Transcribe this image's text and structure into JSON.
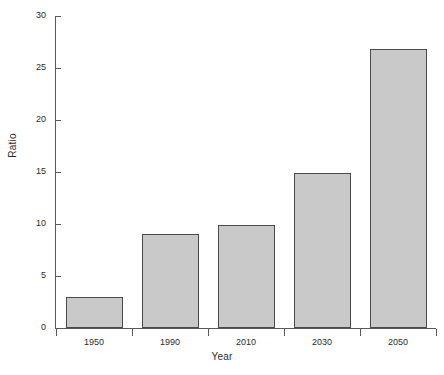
{
  "chart_data": {
    "type": "bar",
    "title": "",
    "subtitle": "",
    "xlabel": "Year",
    "ylabel": "Ratio",
    "categories": [
      "1950",
      "1990",
      "2010",
      "2030",
      "2050"
    ],
    "values": [
      3.0,
      9.0,
      9.9,
      14.9,
      26.8
    ],
    "series": [
      {
        "name": "Ratio",
        "values": [
          3.0,
          9.0,
          9.9,
          14.9,
          26.8
        ]
      }
    ],
    "ylim": [
      0,
      30
    ],
    "y_ticks": [
      0,
      5,
      10,
      15,
      20,
      25,
      30
    ],
    "y_tick_labels": [
      "0",
      "5",
      "10",
      "15",
      "20",
      "25",
      "30"
    ],
    "x_tick_labels": [
      "1950",
      "1990",
      "2010",
      "2030",
      "2050"
    ],
    "grid": false,
    "legend": false,
    "legend_position": "none",
    "annotations": [],
    "colors": {
      "bar_fill": "#c9c9c9",
      "bar_border": "#4a4a4a",
      "axis": "#5a5a5a",
      "text": "#2b2b2b",
      "background": "#ffffff"
    }
  },
  "axes": {
    "y_title": "Ratio",
    "x_title": "Year"
  }
}
